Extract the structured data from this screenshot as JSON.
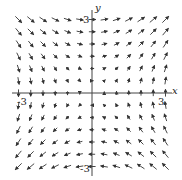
{
  "chart_data": {
    "type": "vector_field",
    "title": "",
    "field": "F(x, y) = <y, x>",
    "xlabel": "x",
    "ylabel": "y",
    "xlim": [
      -3.5,
      3.5
    ],
    "ylim": [
      -3.5,
      3.5
    ],
    "tick_labels": {
      "x": [
        "-3",
        "3"
      ],
      "y": [
        "3",
        "-3"
      ]
    },
    "grid_x": [
      -3,
      -2.5,
      -2,
      -1.5,
      -1,
      -0.5,
      0,
      0.5,
      1,
      1.5,
      2,
      2.5,
      3
    ],
    "grid_y": [
      -3,
      -2.5,
      -2,
      -1.5,
      -1,
      -0.5,
      0,
      0.5,
      1,
      1.5,
      2,
      2.5,
      3
    ],
    "grid": false,
    "legend": null,
    "color": "#333333"
  },
  "axes": {
    "x_label": "x",
    "y_label": "y",
    "x_neg_tick": "-3",
    "x_pos_tick": "3",
    "y_pos_tick": "3",
    "y_neg_tick": "-3"
  }
}
